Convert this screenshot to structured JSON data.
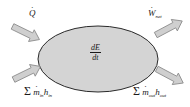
{
  "diagram": {
    "type": "control-volume-energy-balance",
    "colors": {
      "ellipse_fill": "#d4d4d4",
      "ellipse_stroke": "#2a2a2a",
      "arrow_fill": "#cfcfcf",
      "arrow_stroke": "#8a8a8a",
      "text": "#1a1a1a"
    },
    "center": {
      "label_num": "dE",
      "label_den": "dt"
    },
    "flows": {
      "heat_in": {
        "symbol": "Q",
        "direction": "in",
        "position": "top-left"
      },
      "work_out": {
        "symbol": "W",
        "subscript": "net",
        "direction": "out",
        "position": "top-right"
      },
      "mass_in": {
        "prefix": "Σ",
        "m": "m",
        "m_sub": "in",
        "h": "h",
        "h_sub": "in",
        "direction": "in",
        "position": "bottom-left"
      },
      "mass_out": {
        "prefix": "Σ",
        "m": "m",
        "m_sub": "out",
        "h": "h",
        "h_sub": "out",
        "direction": "out",
        "position": "bottom-right"
      }
    }
  }
}
